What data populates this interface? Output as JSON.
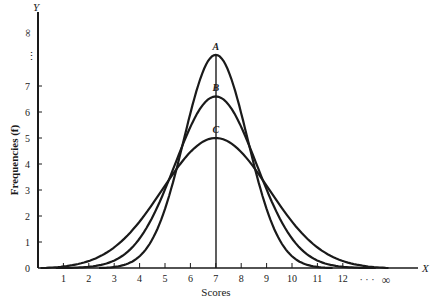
{
  "chart_data": {
    "type": "line",
    "title": "",
    "xlabel": "Scores",
    "ylabel": "Frequencies (f)",
    "x_axis_letter": "X",
    "y_axis_letter": "Y",
    "x_ticks": [
      "1",
      "2",
      "3",
      "4",
      "5",
      "6",
      "7",
      "8",
      "9",
      "10",
      "11",
      "12"
    ],
    "x_tick_values": [
      1,
      2,
      3,
      4,
      5,
      6,
      7,
      8,
      9,
      10,
      11,
      12
    ],
    "x_infinity_label": "∞",
    "x_ellipsis": "· · ·",
    "y_ticks": [
      "0",
      "1",
      "2",
      "3",
      "4",
      "5",
      "6",
      "7"
    ],
    "y_tick_values": [
      0,
      1,
      2,
      3,
      4,
      5,
      6,
      7
    ],
    "y_infinity_label": "∞",
    "y_ellipsis": "⋮",
    "xlim": [
      0,
      14.7
    ],
    "ylim": [
      0,
      8.7
    ],
    "grid": false,
    "legend": "inline labels at curve peaks",
    "mean": 7,
    "series": [
      {
        "name": "A",
        "peak": 8.2,
        "sigma": 1.25,
        "x_start": 2.4,
        "x_end": 11.6
      },
      {
        "name": "B",
        "peak": 6.6,
        "sigma": 1.6,
        "x_start": 0.7,
        "x_end": 13.3
      },
      {
        "name": "C",
        "peak": 5.0,
        "sigma": 2.1,
        "x_start": 0.1,
        "x_end": 13.8
      }
    ]
  }
}
